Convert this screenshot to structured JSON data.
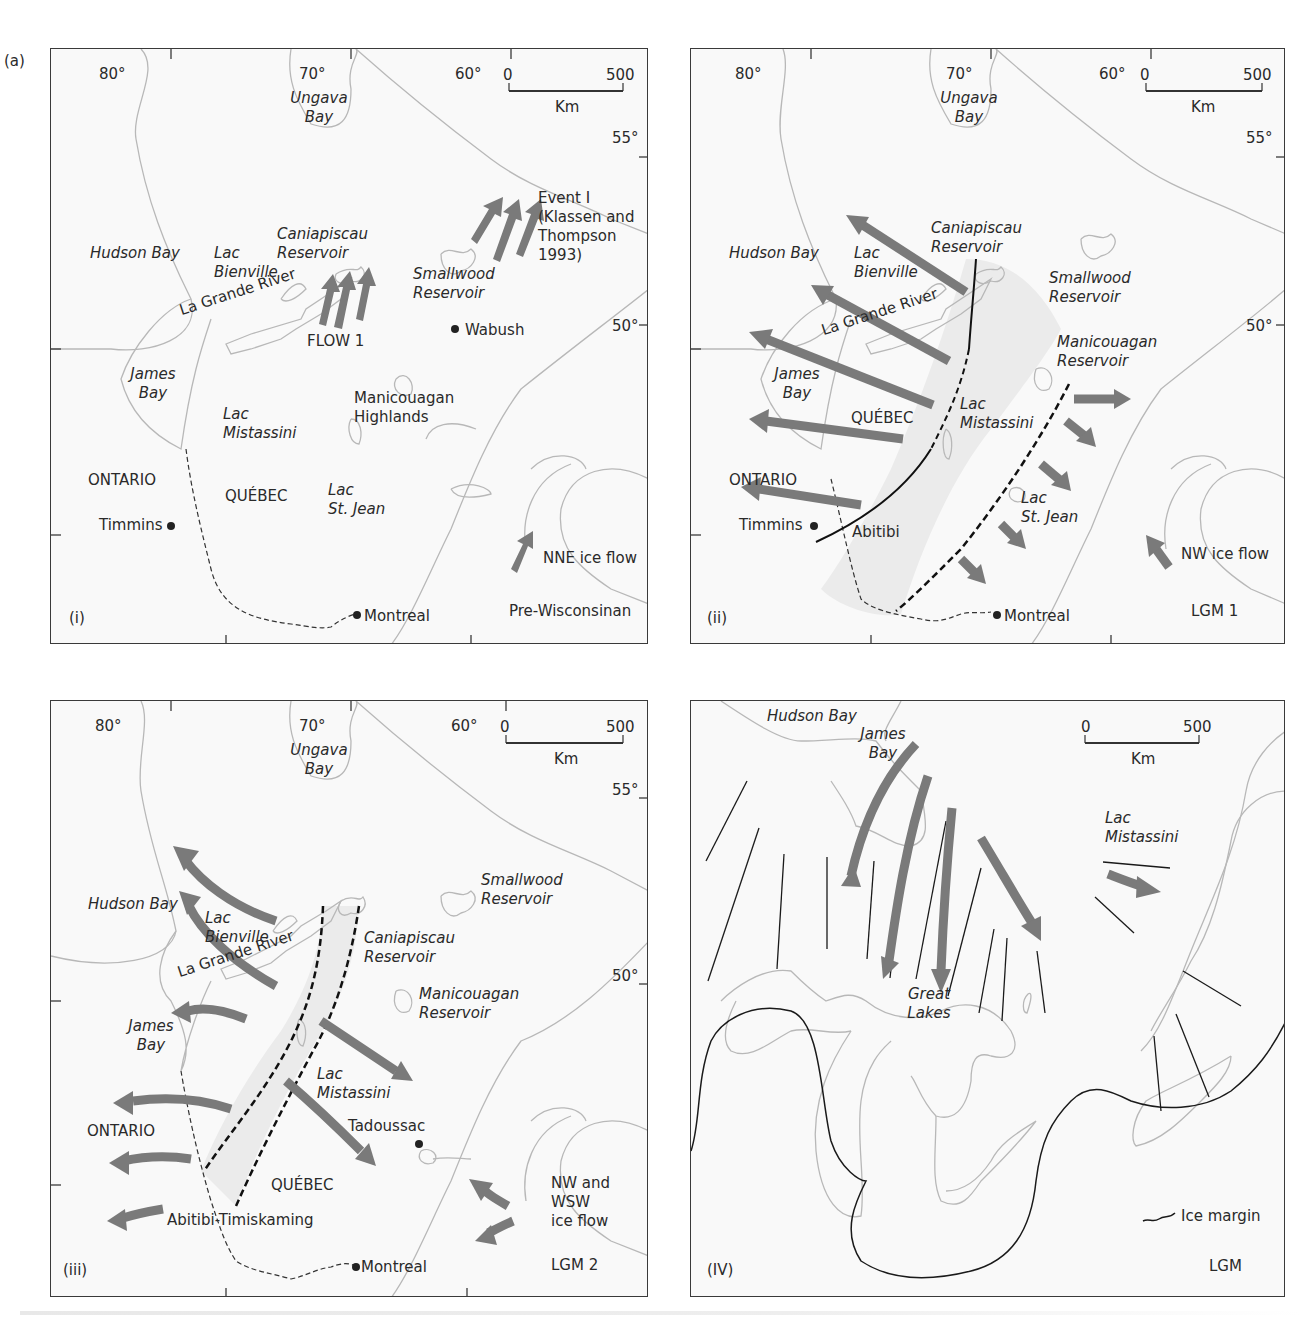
{
  "figure": {
    "label": "(a)",
    "caption_visible": false
  },
  "colors": {
    "coast": "#b8b8b8",
    "frame": "#3a3a3a",
    "arrow": "#7a7a7a",
    "ice_zone": "#ebebeb",
    "text": "#2a2a2a"
  },
  "scale_bar": {
    "start": "0",
    "end": "500",
    "unit": "Km"
  },
  "panels": [
    {
      "id": "i",
      "tag": "(i)",
      "period": "Pre-Wisconsinan",
      "longitudes": [
        "80°",
        "70°",
        "60°"
      ],
      "latitudes": [
        "55°",
        "50°"
      ],
      "labels": {
        "ungava": "Ungava",
        "ungava2": "Bay",
        "hudson": "Hudson Bay",
        "lac_b": "Lac",
        "lac_b2": "Bienville",
        "cani": "Caniapiscau",
        "cani2": "Reservoir",
        "river": "La Grande River",
        "flow": "FLOW 1",
        "small": "Smallwood",
        "small2": "Reservoir",
        "event1": "Event I",
        "event2": "(Klassen and",
        "event3": "Thompson",
        "event4": "1993)",
        "wabush": "Wabush",
        "james": "James",
        "james2": "Bay",
        "mani": "Manicouagan",
        "mani2": "Highlands",
        "lac_m": "Lac",
        "lac_m2": "Mistassini",
        "ontario": "ONTARIO",
        "quebec": "QUÉBEC",
        "lac_s": "Lac",
        "lac_s2": "St. Jean",
        "timmins": "Timmins",
        "montreal": "Montreal",
        "nne": "NNE ice flow"
      }
    },
    {
      "id": "ii",
      "tag": "(ii)",
      "period": "LGM 1",
      "longitudes": [
        "80°",
        "70°",
        "60°"
      ],
      "latitudes": [
        "55°",
        "50°"
      ],
      "labels": {
        "ungava": "Ungava",
        "ungava2": "Bay",
        "hudson": "Hudson Bay",
        "lac_b": "Lac",
        "lac_b2": "Bienville",
        "cani": "Caniapiscau",
        "cani2": "Reservoir",
        "river": "La Grande River",
        "small": "Smallwood",
        "small2": "Reservoir",
        "mani": "Manicouagan",
        "mani2": "Reservoir",
        "james": "James",
        "james2": "Bay",
        "quebec": "QUÉBEC",
        "lac_m": "Lac",
        "lac_m2": "Mistassini",
        "ontario": "ONTARIO",
        "timmins": "Timmins",
        "abitibi": "Abitibi",
        "lac_s": "Lac",
        "lac_s2": "St. Jean",
        "montreal": "Montreal",
        "nw": "NW ice flow"
      }
    },
    {
      "id": "iii",
      "tag": "(iii)",
      "period": "LGM 2",
      "longitudes": [
        "80°",
        "70°",
        "60°"
      ],
      "latitudes": [
        "55°",
        "50°"
      ],
      "labels": {
        "ungava": "Ungava",
        "ungava2": "Bay",
        "hudson": "Hudson Bay",
        "lac_b": "Lac",
        "lac_b2": "Bienville",
        "small": "Smallwood",
        "small2": "Reservoir",
        "cani": "Caniapiscau",
        "cani2": "Reservoir",
        "river": "La Grande River",
        "mani": "Manicouagan",
        "mani2": "Reservoir",
        "james": "James",
        "james2": "Bay",
        "lac_m": "Lac",
        "lac_m2": "Mistassini",
        "ontario": "ONTARIO",
        "tadoussac": "Tadoussac",
        "quebec": "QUÉBEC",
        "abitibi": "Abitibi-Timiskaming",
        "nwwsw1": "NW and",
        "nwwsw2": "WSW",
        "nwwsw3": "ice flow",
        "montreal": "Montreal"
      }
    },
    {
      "id": "iv",
      "tag": "(IV)",
      "period": "LGM",
      "labels": {
        "hudson": "Hudson Bay",
        "james": "James",
        "james2": "Bay",
        "lac_m": "Lac",
        "lac_m2": "Mistassini",
        "great": "Great",
        "great2": "Lakes",
        "legend_ice": "Ice margin"
      }
    }
  ]
}
